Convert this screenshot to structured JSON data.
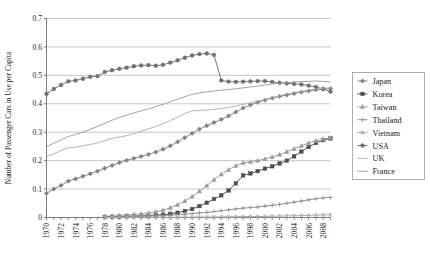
{
  "chart_data": {
    "type": "line",
    "title": "",
    "xlabel": "",
    "ylabel": "Number of Passenger Cars in Use per Capita",
    "ylim": [
      0,
      0.7
    ],
    "ytick_values": [
      0,
      0.1,
      0.2,
      0.3,
      0.4,
      0.5,
      0.6,
      0.7
    ],
    "ytick_labels": [
      "0",
      "0.1",
      "0.2",
      "0.3",
      "0.4",
      "0.5",
      "0.6",
      "0.7"
    ],
    "xlim": [
      1970,
      2009
    ],
    "x": [
      1970,
      1971,
      1972,
      1973,
      1974,
      1975,
      1976,
      1977,
      1978,
      1979,
      1980,
      1981,
      1982,
      1983,
      1984,
      1985,
      1986,
      1987,
      1988,
      1989,
      1990,
      1991,
      1992,
      1993,
      1994,
      1995,
      1996,
      1997,
      1998,
      1999,
      2000,
      2001,
      2002,
      2003,
      2004,
      2005,
      2006,
      2007,
      2008,
      2009
    ],
    "xtick_labels": [
      "1970",
      "1972",
      "1974",
      "1976",
      "1978",
      "1980",
      "1982",
      "1984",
      "1986",
      "1988",
      "1990",
      "1992",
      "1994",
      "1996",
      "1998",
      "2000",
      "2002",
      "2004",
      "2006",
      "2008"
    ],
    "xtick_step": 2,
    "grid": "horizontal",
    "legend_position": "right",
    "series": [
      {
        "name": "Japan",
        "marker": "filled-diamond",
        "color": "#808080",
        "values": [
          0.085,
          0.1,
          0.113,
          0.128,
          0.136,
          0.145,
          0.154,
          0.163,
          0.173,
          0.183,
          0.193,
          0.201,
          0.208,
          0.215,
          0.222,
          0.23,
          0.24,
          0.252,
          0.266,
          0.281,
          0.296,
          0.311,
          0.323,
          0.334,
          0.345,
          0.357,
          0.371,
          0.385,
          0.396,
          0.405,
          0.413,
          0.42,
          0.426,
          0.431,
          0.436,
          0.441,
          0.445,
          0.449,
          0.452,
          0.454
        ]
      },
      {
        "name": "Korea",
        "marker": "filled-square",
        "color": "#4d4d4d",
        "values": [
          null,
          null,
          null,
          null,
          null,
          null,
          null,
          null,
          0.002,
          0.003,
          0.003,
          0.004,
          0.005,
          0.006,
          0.007,
          0.008,
          0.01,
          0.013,
          0.017,
          0.023,
          0.03,
          0.04,
          0.052,
          0.065,
          0.078,
          0.095,
          0.12,
          0.148,
          0.155,
          0.163,
          0.172,
          0.18,
          0.19,
          0.2,
          0.215,
          0.232,
          0.248,
          0.262,
          0.272,
          0.278
        ]
      },
      {
        "name": "Taiwan",
        "marker": "filled-triangle",
        "color": "#9a9a9a",
        "values": [
          null,
          null,
          null,
          null,
          null,
          null,
          null,
          null,
          0.004,
          0.005,
          0.007,
          0.009,
          0.011,
          0.013,
          0.016,
          0.02,
          0.026,
          0.034,
          0.045,
          0.058,
          0.074,
          0.092,
          0.112,
          0.133,
          0.152,
          0.168,
          0.182,
          0.192,
          0.196,
          0.2,
          0.206,
          0.213,
          0.221,
          0.231,
          0.242,
          0.252,
          0.262,
          0.27,
          0.276,
          0.28
        ]
      },
      {
        "name": "Thailand",
        "marker": "cross",
        "color": "#8c8c8c",
        "values": [
          null,
          null,
          null,
          null,
          null,
          null,
          null,
          null,
          0.002,
          0.002,
          0.003,
          0.003,
          0.004,
          0.004,
          0.005,
          0.006,
          0.007,
          0.008,
          0.01,
          0.012,
          0.014,
          0.016,
          0.018,
          0.021,
          0.024,
          0.027,
          0.03,
          0.033,
          0.035,
          0.037,
          0.04,
          0.043,
          0.046,
          0.05,
          0.054,
          0.058,
          0.062,
          0.066,
          0.069,
          0.071
        ]
      },
      {
        "name": "Vietnam",
        "marker": "asterisk",
        "color": "#a6a6a6",
        "values": [
          null,
          null,
          null,
          null,
          null,
          null,
          null,
          null,
          0.0005,
          0.0005,
          0.0006,
          0.0006,
          0.0007,
          0.0007,
          0.0008,
          0.0008,
          0.0009,
          0.001,
          0.0011,
          0.0012,
          0.0013,
          0.0015,
          0.0017,
          0.0019,
          0.0021,
          0.0024,
          0.0027,
          0.003,
          0.0033,
          0.0036,
          0.004,
          0.0045,
          0.005,
          0.0056,
          0.0062,
          0.0068,
          0.0075,
          0.0082,
          0.009,
          0.0098
        ]
      },
      {
        "name": "USA",
        "marker": "filled-circle",
        "color": "#707070",
        "values": [
          0.435,
          0.452,
          0.466,
          0.479,
          0.482,
          0.488,
          0.495,
          0.497,
          0.512,
          0.518,
          0.523,
          0.527,
          0.532,
          0.535,
          0.536,
          0.534,
          0.537,
          0.545,
          0.553,
          0.562,
          0.57,
          0.575,
          0.577,
          0.572,
          0.482,
          0.478,
          0.477,
          0.478,
          0.479,
          0.48,
          0.48,
          0.477,
          0.474,
          0.472,
          0.47,
          0.468,
          0.464,
          0.459,
          0.452,
          0.443
        ]
      },
      {
        "name": "UK",
        "marker": "line",
        "color": "#b0b0b0",
        "values": [
          0.215,
          0.224,
          0.235,
          0.245,
          0.248,
          0.252,
          0.257,
          0.262,
          0.27,
          0.278,
          0.283,
          0.288,
          0.295,
          0.303,
          0.312,
          0.32,
          0.33,
          0.341,
          0.353,
          0.366,
          0.375,
          0.377,
          0.378,
          0.38,
          0.383,
          0.387,
          0.392,
          0.398,
          0.404,
          0.41,
          0.416,
          0.422,
          0.428,
          0.434,
          0.44,
          0.444,
          0.448,
          0.452,
          0.455,
          0.456
        ]
      },
      {
        "name": "France",
        "marker": "line",
        "color": "#9e9e9e",
        "values": [
          0.249,
          0.261,
          0.273,
          0.285,
          0.292,
          0.3,
          0.31,
          0.32,
          0.331,
          0.342,
          0.352,
          0.36,
          0.368,
          0.375,
          0.382,
          0.39,
          0.398,
          0.407,
          0.416,
          0.425,
          0.433,
          0.438,
          0.442,
          0.445,
          0.448,
          0.45,
          0.453,
          0.456,
          0.459,
          0.462,
          0.466,
          0.47,
          0.473,
          0.475,
          0.477,
          0.478,
          0.479,
          0.48,
          0.479,
          0.477
        ]
      }
    ]
  },
  "legend": {
    "items": [
      {
        "label": "Japan"
      },
      {
        "label": "Korea"
      },
      {
        "label": "Taiwan"
      },
      {
        "label": "Thailand"
      },
      {
        "label": "Vietnam"
      },
      {
        "label": "USA"
      },
      {
        "label": "UK"
      },
      {
        "label": "France"
      }
    ]
  }
}
